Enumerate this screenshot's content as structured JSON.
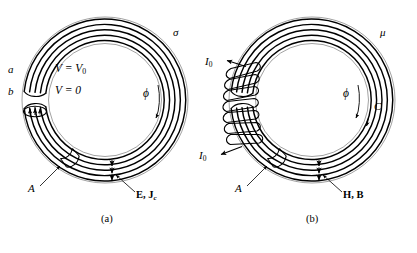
{
  "figure": {
    "type": "physics-diagram",
    "panels": [
      {
        "id": "a",
        "caption": "(a)",
        "labels": {
          "terminal_a": "a",
          "terminal_b": "b",
          "voltage_top": "V = V",
          "voltage_top_sub": "0",
          "voltage_bottom": "V = 0",
          "material": "σ",
          "flux": "ϕ",
          "cross_section": "A",
          "fields": "E, J",
          "fields_sub": "c"
        }
      },
      {
        "id": "b",
        "caption": "(b)",
        "labels": {
          "current_top": "I",
          "current_top_sub": "0",
          "current_bottom": "I",
          "current_bottom_sub": "0",
          "material": "μ",
          "flux": "ϕ",
          "contour": "C",
          "cross_section": "A",
          "fields": "H, B"
        }
      }
    ],
    "colors": {
      "stroke": "#000000",
      "stroke_light": "#6b6b6b",
      "background": "#ffffff"
    }
  }
}
